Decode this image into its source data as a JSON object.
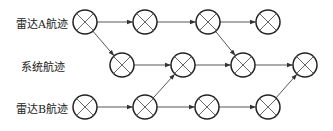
{
  "labels": {
    "radar_a": "雷达A航迹",
    "system": "系统航迹",
    "radar_b": "雷达B航迹"
  },
  "diagram": {
    "node_radius": 12,
    "stroke_color": "#222222",
    "nodes": {
      "a": [
        [
          85,
          22
        ],
        [
          145,
          22
        ],
        [
          208,
          22
        ],
        [
          268,
          22
        ]
      ],
      "s": [
        [
          122,
          65
        ],
        [
          183,
          65
        ],
        [
          243,
          65
        ],
        [
          305,
          65
        ]
      ],
      "b": [
        [
          85,
          107
        ],
        [
          145,
          107
        ],
        [
          207,
          107
        ],
        [
          268,
          107
        ]
      ]
    },
    "edges": [
      [
        "a0",
        "a1"
      ],
      [
        "a1",
        "a2"
      ],
      [
        "a2",
        "a3"
      ],
      [
        "a0",
        "s0"
      ],
      [
        "a2",
        "s2"
      ],
      [
        "s0",
        "s1"
      ],
      [
        "s1",
        "s2"
      ],
      [
        "s2",
        "s3"
      ],
      [
        "b0",
        "b1"
      ],
      [
        "b1",
        "b2"
      ],
      [
        "b2",
        "b3"
      ],
      [
        "b1",
        "s1"
      ],
      [
        "b3",
        "s3"
      ]
    ]
  }
}
